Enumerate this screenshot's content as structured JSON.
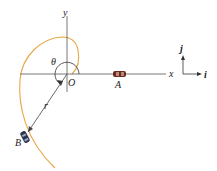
{
  "diagram": {
    "labels": {
      "y_axis": "y",
      "x_axis": "x",
      "origin": "O",
      "theta": "θ",
      "radius": "r",
      "point_a": "A",
      "point_b": "B",
      "unit_j": "j",
      "unit_i": "i"
    },
    "colors": {
      "path": "#e8a544",
      "axes": "#555555",
      "car_a": "#6b2a20",
      "car_b": "#2a3550"
    }
  }
}
